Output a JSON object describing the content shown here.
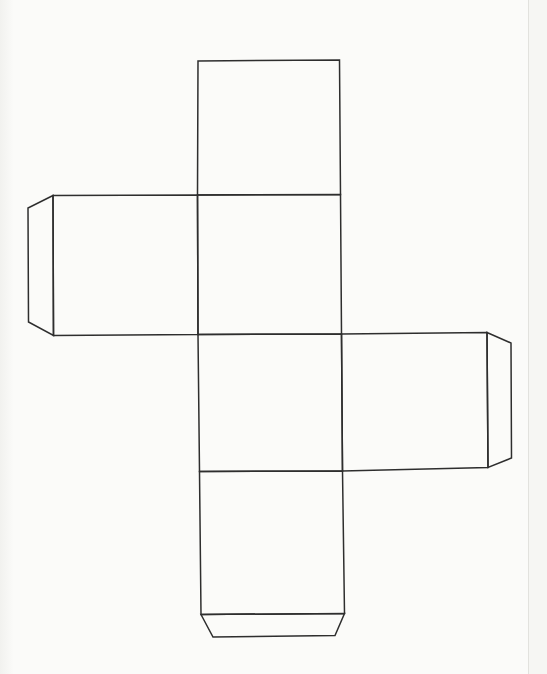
{
  "diagram": {
    "kind": "cube-net-template",
    "canvas": {
      "width": 547,
      "height": 674
    },
    "colors": {
      "background": "#fbfbf9",
      "line": "#2e2e2e",
      "page_edge_line": "#e2e2de",
      "page_edge_band": "#f6f6f3"
    },
    "stroke_width": 1.5,
    "page_edge_x": 528,
    "shapes": [
      {
        "name": "face-top",
        "points": "198,61 339.5,60 340.5,194.5 197.5,195"
      },
      {
        "name": "face-upper-middle",
        "points": "197.5,195 340.5,194.5 341.5,334 198,334.5"
      },
      {
        "name": "face-lower-middle",
        "points": "198,334.5 341.5,334 342.5,471 199.5,471.5"
      },
      {
        "name": "face-bottom",
        "points": "199.5,471.5 342.5,471 344.5,613.5 201,614.5"
      },
      {
        "name": "face-left",
        "points": "53,195.5 197.5,195 198,334.5 53.5,335.5"
      },
      {
        "name": "face-right",
        "points": "341.5,334 487,332.5 488,467.5 342.5,471"
      },
      {
        "name": "tab-left",
        "points": "53,195.5 28,208 28.5,322 53.5,335.5"
      },
      {
        "name": "tab-right",
        "points": "487,332.5 511,343 511.5,458 488,467.5"
      },
      {
        "name": "tab-bottom",
        "points": "201,614.5 213,637 335,635.5 344.5,613.5"
      }
    ]
  }
}
